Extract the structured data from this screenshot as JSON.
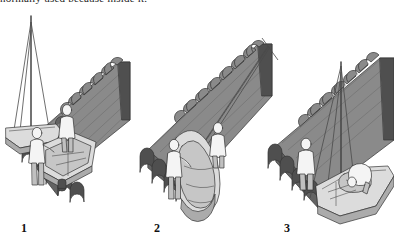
{
  "figure": {
    "caption_line": "normally used because  inside it.",
    "background_color": "#ffffff",
    "width": 394,
    "height": 239,
    "medium": "grayscale line illustration"
  },
  "palette": {
    "outline": "#333333",
    "quay_top": "#8a8a8a",
    "quay_side": "#6e6e6e",
    "quay_shadow": "#4a4a4a",
    "quay_edge_dark": "#5a5a5a",
    "hull_light": "#dcdcdc",
    "hull_mid": "#c4c4c4",
    "hull_shadow": "#a8a8a8",
    "figure_fill": "#f2f2f2",
    "figure_shade": "#bdbdbd",
    "rope": "#555555",
    "mast": "#4d4d4d",
    "water": "#ffffff",
    "text": "#111111"
  },
  "panels": [
    {
      "number": "1",
      "label": "1",
      "description": "Sailboat moored alongside a scalloped stone quay; mast with forestay and shrouds rises at left; two crew stand on the quay beside the dinghy resting on the dock",
      "elements": {
        "quay": "stone quay running diagonally from lower-left to upper-right with arched scalloped edge",
        "sailboat": "hull at lower left, bow pointing left",
        "mast": "tall mast with triangular stay lines",
        "dinghy": "open dinghy resting upright on the quay",
        "crew_count": "2"
      }
    },
    {
      "number": "2",
      "label": "2",
      "description": "Dinghy tilted up on edge and suspended from halyard lines that run up to the right toward the masthead; two crew steady it against the quay",
      "elements": {
        "quay": "stone quay running diagonally from lower-left to upper-right with arched scalloped edge",
        "halyard": "two taut lines from dinghy up to masthead at upper right",
        "dinghy": "dinghy raised on edge, interior thwarts visible",
        "crew_count": "2"
      }
    },
    {
      "number": "3",
      "label": "3",
      "description": "Dinghy lowered and stowed upside down on the sailboat foredeck; one crew stands on the quay, the other leans over the boat securing it",
      "elements": {
        "quay": "stone quay filling the upper area with arched scalloped edge",
        "sailboat": "hull at lower right alongside the quay",
        "mast": "mast with supporting lines",
        "dinghy": "dinghy stowed on deck",
        "crew_count": "2"
      }
    }
  ],
  "numbers": {
    "one": "1",
    "two": "2",
    "three": "3"
  }
}
